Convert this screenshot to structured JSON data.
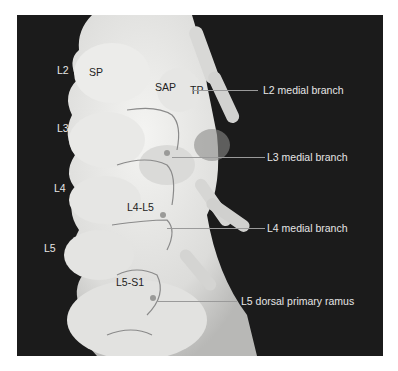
{
  "figure": {
    "colors": {
      "background": "#1b1b1b",
      "bone": "#e8e8e6",
      "nerve": "#8a8a8a",
      "label_light": "#e6e6e6",
      "label_dark": "#222222"
    },
    "level_labels": [
      "L2",
      "L3",
      "L4",
      "L5"
    ],
    "structure_labels": {
      "sp": "SP",
      "sap": "SAP",
      "tp": "TP",
      "l4l5": "L4-L5",
      "l5s1": "L5-S1"
    },
    "nerve_labels": [
      "L2 medial branch",
      "L3 medial branch",
      "L4 medial branch",
      "L5 dorsal primary ramus"
    ]
  }
}
